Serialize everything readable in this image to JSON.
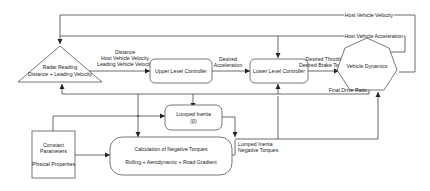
{
  "diagram": {
    "nodes": {
      "radar": {
        "line1": "Radar Reading",
        "line2": "Distance + Leading Velocity"
      },
      "upper": {
        "label": "Upper Level Controller"
      },
      "lower": {
        "label": "Lower Level Controller"
      },
      "dynamics": {
        "label": "Vehicle Dynamics"
      },
      "inertia": {
        "line1": "Lumped Inertia",
        "line2": "(β)"
      },
      "calc": {
        "line1": "Calculation of Negative Torques",
        "line2": "Rolling + Aerodynamic + Road Gradient"
      },
      "constants": {
        "line1": "Constant",
        "line2": "Parameters",
        "line3": "Phisical Properties"
      }
    },
    "edges": {
      "radar_to_upper": {
        "line1": "Distance",
        "line2": "Host Vehicle Velocity",
        "line3": "Leading Vehicle Velocity"
      },
      "upper_to_lower": {
        "line1": "Desired",
        "line2": "Acceleration"
      },
      "lower_to_dynamics": {
        "line1": "Desired Throttle",
        "line2": "Desired Brake Torque"
      },
      "host_velocity": {
        "label": "Host Vehicle Velocity"
      },
      "host_acceleration": {
        "label": "Host Vehicle Acceleration"
      },
      "final_drive": {
        "label": "Final Drive Ratio"
      },
      "negative_torques": {
        "line1": "Lumped Inertia",
        "line2": "Negative Torques"
      }
    }
  }
}
